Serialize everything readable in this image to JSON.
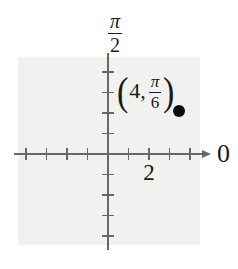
{
  "figure": {
    "plot_area_color": "#f1f1ef",
    "axis_color": "#686868",
    "text_color": "#1a1a1a",
    "point_color": "#0c0c0c"
  },
  "labels": {
    "vertical_axis_numerator": "π",
    "vertical_axis_denominator": "2",
    "polar_axis_label": "0",
    "x_tick_label": "2",
    "point_open_paren": "(",
    "point_r_value": "4,",
    "point_theta_numerator": "π",
    "point_theta_denominator": "6",
    "point_close_paren": ")"
  },
  "chart_data": {
    "type": "scatter",
    "coordinate_system": "polar",
    "title": "",
    "points": [
      {
        "r": 4,
        "theta_label": "π/6",
        "theta_radians": 0.5235987755982988,
        "label": "(4, π/6)"
      }
    ],
    "axes": {
      "polar_axis_end_label": "0",
      "vertical_axis_end_label": "π/2",
      "labeled_tick_value": 2,
      "units_per_tick": 1,
      "tick_values_horizontal": [
        -4,
        -3,
        -2,
        -1,
        1,
        2,
        3,
        4
      ],
      "tick_values_vertical": [
        -4,
        -3,
        -2,
        -1,
        1,
        2,
        3,
        4
      ],
      "grid": false,
      "legend": false
    }
  }
}
